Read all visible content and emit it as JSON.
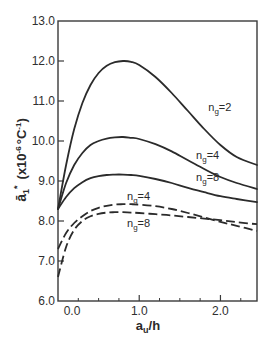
{
  "chart_data": {
    "type": "line",
    "title": "",
    "xlabel": "a_u/h",
    "ylabel": "ā₁* (x10⁻⁶ °C⁻¹)",
    "xlim": [
      0.0,
      2.45
    ],
    "ylim": [
      6.0,
      13.0
    ],
    "grid": false,
    "legend": "inline labels",
    "x_ticks": [
      0.0,
      1.0,
      2.0
    ],
    "x_tick_labels": [
      "0.0",
      "1.0",
      "2.0"
    ],
    "x_minor_ticks": [
      0.25,
      0.5,
      0.75,
      1.25,
      1.5,
      1.75,
      2.25
    ],
    "y_ticks": [
      6.0,
      7.0,
      8.0,
      9.0,
      10.0,
      11.0,
      12.0,
      13.0
    ],
    "y_tick_labels": [
      "6.0",
      "7.0",
      "8.0",
      "9.0",
      "10.0",
      "11.0",
      "12.0",
      "13.0"
    ],
    "series": [
      {
        "name": "n_g=2 (solid)",
        "label": "n",
        "sub": "g",
        "suffix": "=2",
        "style": "solid",
        "label_pos": [
          1.85,
          10.75
        ],
        "x": [
          0.0,
          0.1,
          0.2,
          0.3,
          0.4,
          0.5,
          0.6,
          0.7,
          0.8,
          0.9,
          1.0,
          1.2,
          1.4,
          1.6,
          1.8,
          2.0,
          2.2,
          2.45
        ],
        "y": [
          8.3,
          9.4,
          10.3,
          10.95,
          11.4,
          11.7,
          11.88,
          11.97,
          12.0,
          11.98,
          11.9,
          11.6,
          11.2,
          10.75,
          10.3,
          9.9,
          9.6,
          9.4
        ]
      },
      {
        "name": "n_g=4 (solid)",
        "label": "n",
        "sub": "g",
        "suffix": "=4",
        "style": "solid",
        "label_pos": [
          1.7,
          9.55
        ],
        "x": [
          0.0,
          0.1,
          0.2,
          0.3,
          0.4,
          0.5,
          0.6,
          0.7,
          0.8,
          0.9,
          1.0,
          1.2,
          1.4,
          1.6,
          1.8,
          2.0,
          2.2,
          2.45
        ],
        "y": [
          8.3,
          8.95,
          9.4,
          9.7,
          9.9,
          10.0,
          10.06,
          10.09,
          10.1,
          10.08,
          10.05,
          9.92,
          9.74,
          9.52,
          9.3,
          9.1,
          8.95,
          8.8
        ]
      },
      {
        "name": "n_g=8 (solid)",
        "label": "n",
        "sub": "g",
        "suffix": "=8",
        "style": "solid",
        "label_pos": [
          1.7,
          9.0
        ],
        "x": [
          0.0,
          0.1,
          0.2,
          0.3,
          0.4,
          0.5,
          0.6,
          0.7,
          0.8,
          0.9,
          1.0,
          1.2,
          1.4,
          1.6,
          1.8,
          2.0,
          2.2,
          2.45
        ],
        "y": [
          8.3,
          8.6,
          8.82,
          8.97,
          9.07,
          9.12,
          9.15,
          9.16,
          9.16,
          9.15,
          9.13,
          9.05,
          8.95,
          8.83,
          8.72,
          8.62,
          8.55,
          8.47
        ]
      },
      {
        "name": "n_g=4 (dashed)",
        "label": "n",
        "sub": "g",
        "suffix": "=4",
        "style": "dashed",
        "label_pos": [
          0.85,
          8.52
        ],
        "x": [
          0.0,
          0.1,
          0.2,
          0.3,
          0.4,
          0.5,
          0.6,
          0.7,
          0.8,
          0.9,
          1.0,
          1.2,
          1.4,
          1.6,
          1.8,
          2.0,
          2.2,
          2.45
        ],
        "y": [
          7.3,
          7.7,
          7.95,
          8.12,
          8.25,
          8.33,
          8.38,
          8.41,
          8.42,
          8.42,
          8.41,
          8.37,
          8.3,
          8.2,
          8.09,
          7.98,
          7.88,
          7.75
        ]
      },
      {
        "name": "n_g=8 (dashed)",
        "label": "n",
        "sub": "g",
        "suffix": "=8",
        "style": "dashed",
        "label_pos": [
          0.85,
          7.85
        ],
        "x": [
          0.0,
          0.1,
          0.2,
          0.3,
          0.4,
          0.5,
          0.6,
          0.7,
          0.8,
          0.9,
          1.0,
          1.2,
          1.4,
          1.6,
          1.8,
          2.0,
          2.2,
          2.45
        ],
        "y": [
          6.6,
          7.35,
          7.78,
          8.0,
          8.12,
          8.18,
          8.21,
          8.22,
          8.22,
          8.21,
          8.2,
          8.17,
          8.14,
          8.1,
          8.06,
          8.02,
          7.97,
          7.92
        ]
      }
    ]
  },
  "axes": {
    "x_title_main": "a",
    "x_title_sub": "u",
    "x_title_tail": "/h",
    "y_title_symbol": "ā",
    "y_title_sub": "1",
    "y_title_sup": "*",
    "y_title_units": "(x10",
    "y_title_exp": "-6",
    "y_title_units2": "°C",
    "y_title_exp2": "-1",
    "y_title_close": ")"
  },
  "colors": {
    "line": "#2b2b2b",
    "axis": "#3a3a3a",
    "background": "#ffffff"
  }
}
